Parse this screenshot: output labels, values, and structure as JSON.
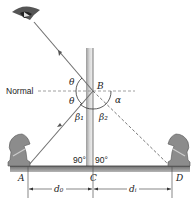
{
  "diagram": {
    "type": "plane-mirror-reflection",
    "labels": {
      "normal": "Normal",
      "point_A": "A",
      "point_B": "B",
      "point_C": "C",
      "point_D": "D",
      "theta_upper": "θ",
      "theta_lower": "θ",
      "beta1": "β₁",
      "beta2": "β₂",
      "alpha": "α",
      "angle_left": "90°",
      "angle_right": "90°",
      "d_object": "d₀",
      "d_image": "dᵢ"
    },
    "elements": [
      "eye",
      "mirror",
      "object-knight",
      "image-knight",
      "incident-ray",
      "reflected-ray",
      "virtual-ray",
      "ground"
    ],
    "colors": {
      "mirror": "#b0b0b0",
      "ground": "#8a8a8a",
      "ray": "#707070",
      "knight": "#8c8c8c"
    }
  }
}
